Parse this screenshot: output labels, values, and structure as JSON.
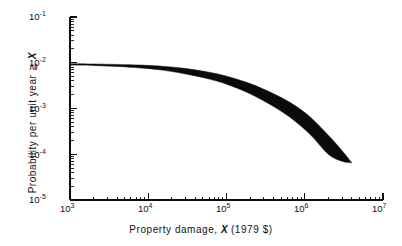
{
  "figure": {
    "width": 402,
    "height": 246,
    "background": "#ffffff",
    "ink_color": "#0a0a0a"
  },
  "axes": {
    "ylabel_prefix": "Probability per unit year ",
    "ylabel_symbol_prefix": "≧ ",
    "ylabel_symbol": "X",
    "xlabel_prefix": "Property damage, ",
    "xlabel_symbol": "X",
    "xlabel_suffix": " (1979 $)",
    "y_ticks": [
      {
        "mantissa": "10",
        "exponent": "-1"
      },
      {
        "mantissa": "10",
        "exponent": "-2"
      },
      {
        "mantissa": "10",
        "exponent": "-3"
      },
      {
        "mantissa": "10",
        "exponent": "-4"
      },
      {
        "mantissa": "10",
        "exponent": "-5"
      }
    ],
    "x_ticks": [
      {
        "mantissa": "10",
        "exponent": "3"
      },
      {
        "mantissa": "10",
        "exponent": "4"
      },
      {
        "mantissa": "10",
        "exponent": "5"
      },
      {
        "mantissa": "10",
        "exponent": "6"
      },
      {
        "mantissa": "10",
        "exponent": "7"
      }
    ]
  },
  "chart_data": {
    "type": "area",
    "title": "",
    "subtitle": "",
    "xlabel": "Property damage, X (1979 $)",
    "ylabel": "Probability per unit year ≧ X",
    "xscale": "log",
    "yscale": "log",
    "xlim": [
      1000,
      10000000
    ],
    "ylim": [
      1e-05,
      0.1
    ],
    "grid": false,
    "legend": null,
    "annotations": [],
    "x_tick_values": [
      1000,
      10000,
      100000,
      1000000,
      10000000
    ],
    "y_tick_values": [
      0.1,
      0.01,
      0.001,
      0.0001,
      1e-05
    ],
    "x_minor_ticks": true,
    "y_minor_ticks": true,
    "spines": [
      "left",
      "bottom"
    ],
    "series": [
      {
        "name": "upper bound",
        "x": [
          1000,
          2000,
          4000,
          8000,
          15000,
          30000,
          60000,
          100000,
          200000,
          400000,
          700000,
          1200000,
          2000000,
          3000000,
          4000000
        ],
        "values": [
          0.0095,
          0.0094,
          0.0092,
          0.0089,
          0.0084,
          0.0075,
          0.0062,
          0.0051,
          0.0035,
          0.0021,
          0.00125,
          0.00063,
          0.00026,
          0.00012,
          6.5e-05
        ]
      },
      {
        "name": "lower bound",
        "x": [
          1000,
          2000,
          4000,
          8000,
          15000,
          30000,
          60000,
          100000,
          200000,
          400000,
          700000,
          1200000,
          2000000,
          3000000,
          4000000
        ],
        "values": [
          0.0089,
          0.0087,
          0.0083,
          0.0077,
          0.0069,
          0.0057,
          0.0044,
          0.0034,
          0.0021,
          0.0011,
          0.00058,
          0.00026,
          0.0001,
          7e-05,
          6.5e-05
        ]
      }
    ]
  }
}
